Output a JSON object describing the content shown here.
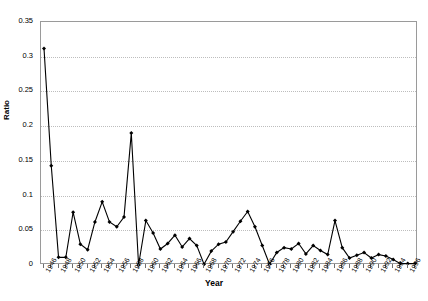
{
  "chart_data": {
    "type": "line",
    "title": "",
    "xlabel": "Year",
    "ylabel": "Ratio",
    "ylim": [
      0,
      0.35
    ],
    "ytick_values": [
      0,
      0.05,
      0.1,
      0.15,
      0.2,
      0.25,
      0.3,
      0.35
    ],
    "ytick_labels": [
      "0",
      "0.05",
      "0.1",
      "0.15",
      "0.2",
      "0.25",
      "0.3",
      "0.35"
    ],
    "xlim": [
      1946,
      1997
    ],
    "xtick_labels": [
      "1946",
      "1948",
      "1950",
      "1952",
      "1954",
      "1956",
      "1958",
      "1960",
      "1962",
      "1964",
      "1966",
      "1968",
      "1970",
      "1972",
      "1974",
      "1976",
      "1978",
      "1980",
      "1982",
      "1984",
      "1986",
      "1988",
      "1990",
      "1992",
      "1994",
      "1996"
    ],
    "xtick_step": 2,
    "grid": "horizontal-dotted",
    "legend": "none",
    "marker": "diamond",
    "line_color": "#000000",
    "marker_color": "#000000",
    "grid_color": "#bdbdbd",
    "frame_color": "#9a9a9a",
    "background": "#ffffff",
    "x": [
      1946,
      1947,
      1948,
      1949,
      1950,
      1951,
      1952,
      1953,
      1954,
      1955,
      1956,
      1957,
      1958,
      1959,
      1960,
      1961,
      1962,
      1963,
      1964,
      1965,
      1966,
      1967,
      1968,
      1969,
      1970,
      1971,
      1972,
      1973,
      1974,
      1975,
      1976,
      1977,
      1978,
      1979,
      1980,
      1981,
      1982,
      1983,
      1984,
      1985,
      1986,
      1987,
      1988,
      1989,
      1990,
      1991,
      1992,
      1993,
      1994,
      1995,
      1996,
      1997
    ],
    "values": [
      0.312,
      0.143,
      0.011,
      0.011,
      0.076,
      0.03,
      0.022,
      0.062,
      0.091,
      0.062,
      0.055,
      0.069,
      0.19,
      0.0,
      0.064,
      0.046,
      0.023,
      0.031,
      0.043,
      0.026,
      0.038,
      0.028,
      0.001,
      0.02,
      0.03,
      0.033,
      0.048,
      0.063,
      0.077,
      0.055,
      0.028,
      0.001,
      0.018,
      0.025,
      0.023,
      0.031,
      0.016,
      0.028,
      0.021,
      0.015,
      0.064,
      0.025,
      0.01,
      0.014,
      0.018,
      0.01,
      0.015,
      0.013,
      0.008,
      0.002,
      0.002,
      0.002
    ],
    "series": [
      {
        "name": "Ratio",
        "values": [
          0.312,
          0.143,
          0.011,
          0.011,
          0.076,
          0.03,
          0.022,
          0.062,
          0.091,
          0.062,
          0.055,
          0.069,
          0.19,
          0.0,
          0.064,
          0.046,
          0.023,
          0.031,
          0.043,
          0.026,
          0.038,
          0.028,
          0.001,
          0.02,
          0.03,
          0.033,
          0.048,
          0.063,
          0.077,
          0.055,
          0.028,
          0.001,
          0.018,
          0.025,
          0.023,
          0.031,
          0.016,
          0.028,
          0.021,
          0.015,
          0.064,
          0.025,
          0.01,
          0.014,
          0.018,
          0.01,
          0.015,
          0.013,
          0.008,
          0.002,
          0.002,
          0.002
        ]
      }
    ]
  }
}
